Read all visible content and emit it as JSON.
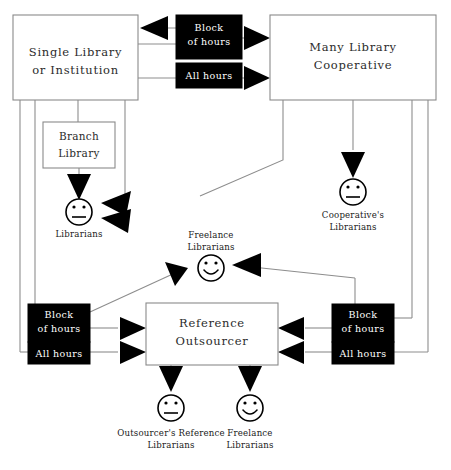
{
  "diagram": {
    "type": "flow-diagram",
    "title_partial_cut_off": "",
    "background_color": "#ffffff",
    "line_color": "#8d8d8d",
    "arrow_color": "#000000",
    "black_box_color": "#000000",
    "black_box_text_color": "#ffffff",
    "boxes": [
      {
        "id": "single-library",
        "label_line1": "Single Library",
        "label_line2": "or Institution",
        "style": "outline"
      },
      {
        "id": "many-library-cooperative",
        "label_line1": "Many Library",
        "label_line2": "Cooperative",
        "style": "outline"
      },
      {
        "id": "branch-library",
        "label_line1": "Branch",
        "label_line2": "Library",
        "style": "outline"
      },
      {
        "id": "reference-outsourcer",
        "label_line1": "Reference",
        "label_line2": "Outsourcer",
        "style": "outline"
      }
    ],
    "black_boxes": [
      {
        "id": "block-of-hours-top",
        "label_line1": "Block",
        "label_line2": "of hours"
      },
      {
        "id": "all-hours-top",
        "label_line1": "All hours",
        "label_line2": ""
      },
      {
        "id": "block-of-hours-left",
        "label_line1": "Block",
        "label_line2": "of hours"
      },
      {
        "id": "all-hours-left",
        "label_line1": "All hours",
        "label_line2": ""
      },
      {
        "id": "block-of-hours-right",
        "label_line1": "Block",
        "label_line2": "of hours"
      },
      {
        "id": "all-hours-right",
        "label_line1": "All hours",
        "label_line2": ""
      }
    ],
    "actors": [
      {
        "id": "librarians",
        "face": "neutral",
        "caption_line1": "Librarians",
        "caption_line2": ""
      },
      {
        "id": "cooperatives-librarians",
        "face": "neutral",
        "caption_line1": "Cooperative's",
        "caption_line2": "Librarians"
      },
      {
        "id": "freelance-librarians-top",
        "face": "smiley",
        "caption_line1": "Freelance",
        "caption_line2": "Librarians"
      },
      {
        "id": "outsourcers-reference-librarians",
        "face": "neutral",
        "caption_line1": "Outsourcer's Reference",
        "caption_line2": "Librarians"
      },
      {
        "id": "freelance-librarians-bottom",
        "face": "smiley",
        "caption_line1": "Freelance",
        "caption_line2": "Librarians"
      }
    ]
  }
}
